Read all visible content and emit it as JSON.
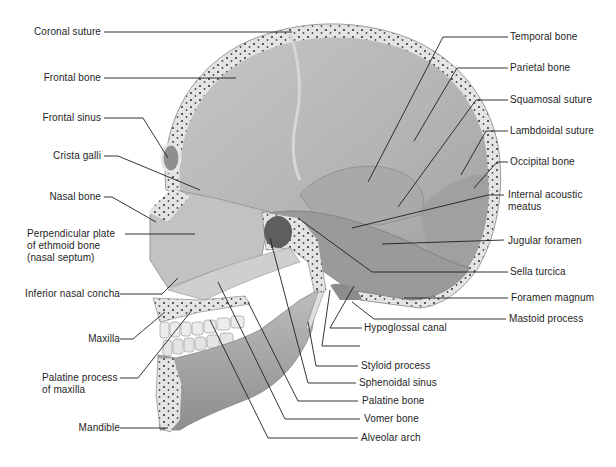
{
  "colors": {
    "bone_fill": "#bdbdbd",
    "bone_dark": "#8a8a8a",
    "cut_edge": "#e2e2e2",
    "diploe_dot": "#3c3c3c",
    "leader": "#1e1e1e",
    "text": "#1e1e1e"
  },
  "labels_left": [
    {
      "id": "coronal-suture",
      "text": "Coronal suture"
    },
    {
      "id": "frontal-bone",
      "text": "Frontal bone"
    },
    {
      "id": "frontal-sinus",
      "text": "Frontal sinus"
    },
    {
      "id": "crista-galli",
      "text": "Crista galli"
    },
    {
      "id": "nasal-bone",
      "text": "Nasal bone"
    },
    {
      "id": "perpendicular-plate",
      "text": "Perpendicular plate",
      "line2": "of ethmoid bone",
      "line3": "(nasal septum)"
    },
    {
      "id": "inferior-nasal-concha",
      "text": "Inferior nasal concha"
    },
    {
      "id": "maxilla",
      "text": "Maxilla"
    },
    {
      "id": "palatine-process",
      "text": "Palatine process",
      "line2": "of maxilla"
    },
    {
      "id": "mandible",
      "text": "Mandible"
    }
  ],
  "labels_right": [
    {
      "id": "temporal-bone",
      "text": "Temporal bone"
    },
    {
      "id": "parietal-bone",
      "text": "Parietal bone"
    },
    {
      "id": "squamosal-suture",
      "text": "Squamosal suture"
    },
    {
      "id": "lambdoidal-suture",
      "text": "Lambdoidal suture"
    },
    {
      "id": "occipital-bone",
      "text": "Occipital bone"
    },
    {
      "id": "internal-acoustic-meatus",
      "text": "Internal acoustic",
      "line2": "meatus"
    },
    {
      "id": "jugular-foramen",
      "text": "Jugular foramen"
    },
    {
      "id": "sella-turcica",
      "text": "Sella turcica"
    },
    {
      "id": "foramen-magnum",
      "text": "Foramen magnum"
    },
    {
      "id": "mastoid-process",
      "text": "Mastoid process"
    }
  ],
  "labels_bottom": [
    {
      "id": "hypoglossal-canal",
      "text": "Hypoglossal canal"
    },
    {
      "id": "unlabeled-leader",
      "text": ""
    },
    {
      "id": "styloid-process",
      "text": "Styloid process"
    },
    {
      "id": "sphenoidal-sinus",
      "text": "Sphenoidal sinus"
    },
    {
      "id": "palatine-bone",
      "text": "Palatine bone"
    },
    {
      "id": "vomer-bone",
      "text": "Vomer bone"
    },
    {
      "id": "alveolar-arch",
      "text": "Alveolar arch"
    }
  ]
}
